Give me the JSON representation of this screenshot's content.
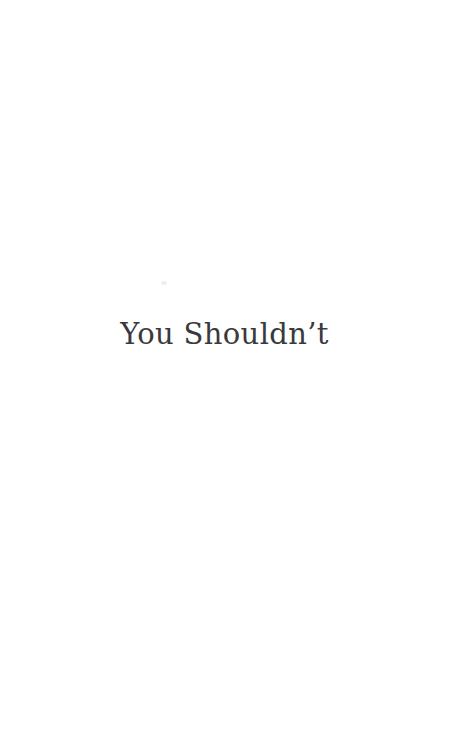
{
  "page": {
    "kind": "book-chapter-title-page",
    "background_color": "#ffffff",
    "width": 449,
    "height": 740
  },
  "title": {
    "text": "You Shouldn’t",
    "color": "#3a3a3c",
    "alignment": "center"
  },
  "artifacts": {
    "speck": {
      "name": "scan-speck",
      "color": "#ececee"
    }
  }
}
